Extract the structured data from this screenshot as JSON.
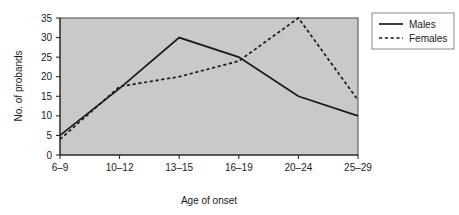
{
  "chart_data": {
    "type": "line",
    "title": "",
    "xlabel": "Age of onset",
    "ylabel": "No. of probands",
    "categories": [
      "6–9",
      "10–12",
      "13–15",
      "16–19",
      "20–24",
      "25–29"
    ],
    "ylim": [
      0,
      35
    ],
    "yticks": [
      0,
      5,
      10,
      15,
      20,
      25,
      30,
      35
    ],
    "ytick_labels": [
      "0",
      "5",
      "10",
      "15",
      "20",
      "25",
      "30",
      "35"
    ],
    "grid": false,
    "legend_position": "right-top",
    "plot_background": "#c9c9c9",
    "series": [
      {
        "name": "Males",
        "style": "solid",
        "color": "#1a1a1a",
        "values": [
          5,
          17,
          30,
          25,
          15,
          10
        ]
      },
      {
        "name": "Females",
        "style": "dashed",
        "color": "#1a1a1a",
        "values": [
          4,
          17.5,
          20,
          24,
          35,
          14
        ]
      }
    ]
  },
  "legend": {
    "items": [
      {
        "label": "Males"
      },
      {
        "label": "Females"
      }
    ]
  }
}
